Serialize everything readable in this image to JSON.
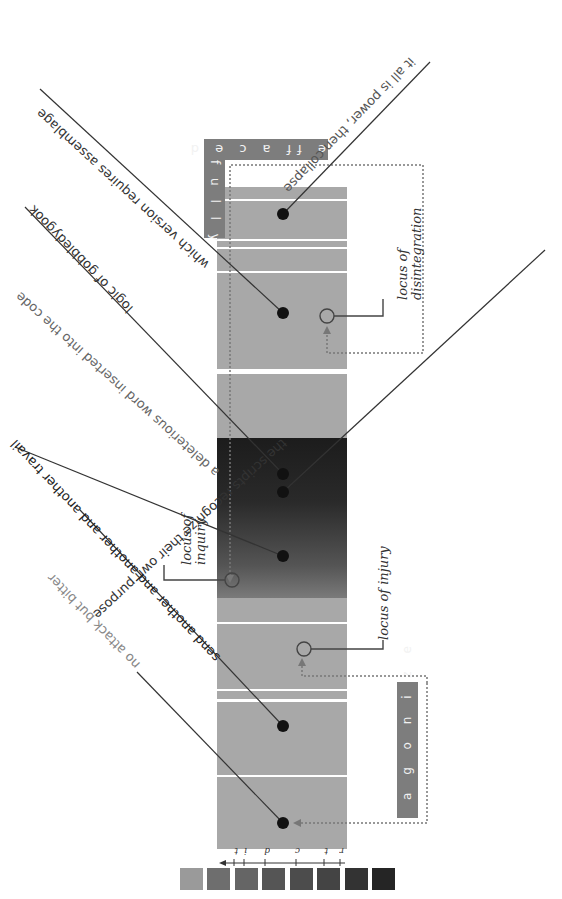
{
  "diagram": {
    "orientation": "rotated 180°",
    "column": {
      "segments": [
        {
          "top": 187,
          "height": 12,
          "color": "#a8a8a8"
        },
        {
          "top": 201,
          "height": 38,
          "color": "#a8a8a8"
        },
        {
          "top": 241,
          "height": 6,
          "color": "#a8a8a8"
        },
        {
          "top": 249,
          "height": 22,
          "color": "#a8a8a8"
        },
        {
          "top": 273,
          "height": 96,
          "color": "#a8a8a8"
        },
        {
          "top": 374,
          "height": 64,
          "color": "#a8a8a8"
        },
        {
          "top": 438,
          "height": 160,
          "color": "dark-gradient"
        },
        {
          "top": 598,
          "height": 24,
          "color": "#a8a8a8"
        },
        {
          "top": 624,
          "height": 65,
          "color": "#a8a8a8"
        },
        {
          "top": 691,
          "height": 8,
          "color": "#a8a8a8"
        },
        {
          "top": 702,
          "height": 73,
          "color": "#a8a8a8"
        },
        {
          "top": 777,
          "height": 72,
          "color": "#a8a8a8"
        }
      ]
    },
    "tags": {
      "fully": "f u l l y",
      "effaced": "e ff a c e d",
      "agonize": "a g o n i z e"
    },
    "loci": {
      "disintegration": [
        "locus of",
        "disintegration"
      ],
      "inquiry": [
        "locus of",
        "inquiry"
      ],
      "injury": "locus of injury"
    },
    "phrases": [
      {
        "text": "it all is power, then collapse",
        "color": "#555"
      },
      {
        "text": "which version requires assemblage",
        "color": "#333"
      },
      {
        "text": "logic of gobbledygook",
        "color": "#333"
      },
      {
        "text": "a deleterious word inserted into the code",
        "color": "#666"
      },
      {
        "text": "the scripts recognize their own purpose",
        "color": "#333"
      },
      {
        "text": "send another and another and another travail",
        "color": "#222"
      },
      {
        "text": "no attack but bitter",
        "color": "#888"
      }
    ],
    "legend": {
      "ticks": [
        "t",
        "i",
        "d",
        "c",
        "t",
        "r"
      ],
      "swatches": [
        "#9a9a9a",
        "#6e6e6e",
        "#656565",
        "#555555",
        "#4c4c4c",
        "#444444",
        "#333333",
        "#252525"
      ]
    }
  }
}
